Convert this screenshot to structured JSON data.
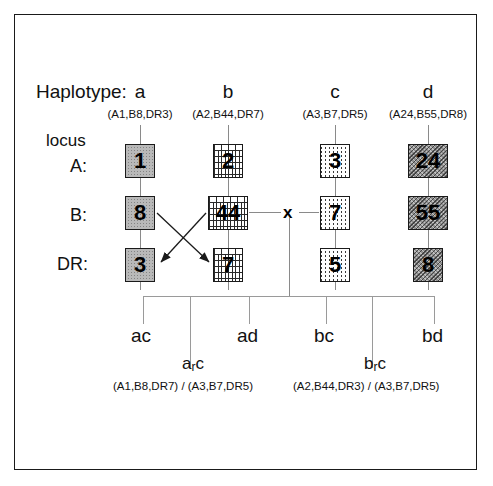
{
  "figure": {
    "title_label": "Haplotype:",
    "locus_word": "locus"
  },
  "columns": [
    {
      "id": "a",
      "letter": "a",
      "alleles": "(A1,B8,DR3)",
      "A": "1",
      "B": "8",
      "DR": "3",
      "pattern": "gray-stipple"
    },
    {
      "id": "b",
      "letter": "b",
      "alleles": "(A2,B44,DR7)",
      "A": "2",
      "B": "44",
      "DR": "7",
      "pattern": "brick"
    },
    {
      "id": "c",
      "letter": "c",
      "alleles": "(A3,B7,DR5)",
      "A": "3",
      "B": "7",
      "DR": "5",
      "pattern": "vertical-dash"
    },
    {
      "id": "d",
      "letter": "d",
      "alleles": "(A24,B55,DR8)",
      "A": "24",
      "B": "55",
      "DR": "8",
      "pattern": "dark-hatch"
    }
  ],
  "loci": [
    {
      "id": "A",
      "label": "A:"
    },
    {
      "id": "B",
      "label": "B:"
    },
    {
      "id": "DR",
      "label": "DR:"
    }
  ],
  "cross": {
    "symbol": "x"
  },
  "offspring": [
    {
      "label": "ac"
    },
    {
      "label": "ad"
    },
    {
      "label": "bc"
    },
    {
      "label": "bd"
    }
  ],
  "recombinants": [
    {
      "label_main": "a",
      "label_sub": "r",
      "label_tail": "c",
      "genotype": "(A1,B8,DR7) / (A3,B7,DR5)"
    },
    {
      "label_main": "b",
      "label_sub": "r",
      "label_tail": "c",
      "genotype": "(A2,B44,DR3) / (A3,B7,DR5)"
    }
  ],
  "colors": {
    "frame": "#1a1a1a",
    "line": "#8a8a8a",
    "text": "#111111",
    "background": "#ffffff"
  }
}
